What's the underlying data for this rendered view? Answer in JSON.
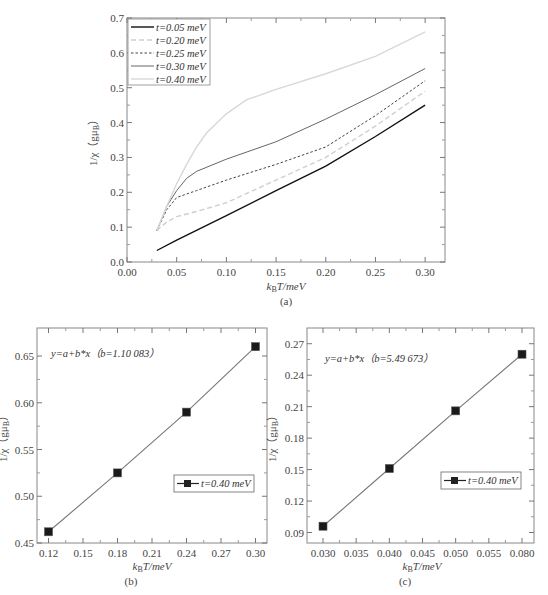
{
  "chart_data": [
    {
      "type": "line",
      "panel_label": "(a)",
      "title": "",
      "xlabel": "k_B T/meV",
      "ylabel": "1/χ (gμ_B)",
      "xlim": [
        0.0,
        0.32
      ],
      "ylim": [
        0.0,
        0.7
      ],
      "xticks": [
        "0.00",
        "0.05",
        "0.10",
        "0.15",
        "0.20",
        "0.25",
        "0.30"
      ],
      "yticks": [
        "0.0",
        "0.1",
        "0.2",
        "0.3",
        "0.4",
        "0.5",
        "0.6",
        "0.7"
      ],
      "grid": false,
      "legend_position": "upper left",
      "series": [
        {
          "name": "t=0.05 meV",
          "style": "solid-black",
          "x": [
            0.03,
            0.05,
            0.1,
            0.15,
            0.2,
            0.25,
            0.3
          ],
          "y": [
            0.033,
            0.063,
            0.133,
            0.205,
            0.275,
            0.36,
            0.45
          ]
        },
        {
          "name": "t=0.20 meV",
          "style": "dashed-lightgray",
          "x": [
            0.03,
            0.04,
            0.05,
            0.07,
            0.1,
            0.15,
            0.2,
            0.25,
            0.3
          ],
          "y": [
            0.09,
            0.115,
            0.13,
            0.145,
            0.17,
            0.235,
            0.3,
            0.39,
            0.49
          ]
        },
        {
          "name": "t=0.25 meV",
          "style": "dotted-darkgray",
          "x": [
            0.03,
            0.04,
            0.05,
            0.06,
            0.07,
            0.1,
            0.15,
            0.2,
            0.25,
            0.3
          ],
          "y": [
            0.09,
            0.15,
            0.185,
            0.195,
            0.205,
            0.235,
            0.28,
            0.33,
            0.42,
            0.52
          ]
        },
        {
          "name": "t=0.30 meV",
          "style": "solid-gray",
          "x": [
            0.03,
            0.04,
            0.05,
            0.06,
            0.07,
            0.1,
            0.15,
            0.2,
            0.25,
            0.3
          ],
          "y": [
            0.09,
            0.16,
            0.205,
            0.24,
            0.26,
            0.295,
            0.345,
            0.41,
            0.48,
            0.555
          ]
        },
        {
          "name": "t=0.40 meV",
          "style": "solid-lightgray",
          "x": [
            0.03,
            0.04,
            0.05,
            0.06,
            0.07,
            0.08,
            0.1,
            0.12,
            0.15,
            0.2,
            0.25,
            0.3
          ],
          "y": [
            0.09,
            0.16,
            0.225,
            0.28,
            0.33,
            0.37,
            0.425,
            0.465,
            0.495,
            0.54,
            0.59,
            0.66
          ]
        }
      ]
    },
    {
      "type": "line",
      "panel_label": "(b)",
      "title": "",
      "annotation": "y=a+b*x (b=1.10 083)",
      "xlabel": "k_B T/meV",
      "ylabel": "1/χ (gμ_B)",
      "xlim": [
        0.11,
        0.31
      ],
      "ylim": [
        0.45,
        0.68
      ],
      "xticks": [
        "0.12",
        "0.15",
        "0.18",
        "0.21",
        "0.24",
        "0.27",
        "0.30"
      ],
      "yticks": [
        "0.45",
        "0.50",
        "0.55",
        "0.60",
        "0.65"
      ],
      "grid": false,
      "legend_position": "center right",
      "series": [
        {
          "name": "t=0.40 meV",
          "marker": "square",
          "x": [
            0.12,
            0.18,
            0.24,
            0.3
          ],
          "y": [
            0.462,
            0.525,
            0.59,
            0.66
          ]
        }
      ]
    },
    {
      "type": "line",
      "panel_label": "(c)",
      "title": "",
      "annotation": "y=a+b*x (b=5.49 673)",
      "xlabel": "k_B T/meV",
      "ylabel": "1/χ (gμ_B)",
      "xlim": [
        0.0275,
        0.0825
      ],
      "ylim": [
        0.08,
        0.285
      ],
      "xticks": [
        "0.030",
        "0.035",
        "0.040",
        "0.045",
        "0.050",
        "0.055",
        "0.080"
      ],
      "yticks": [
        "0.09",
        "0.12",
        "0.15",
        "0.18",
        "0.21",
        "0.24",
        "0.27"
      ],
      "grid": false,
      "legend_position": "center right",
      "series": [
        {
          "name": "t=0.40 meV",
          "marker": "square",
          "x": [
            0.03,
            0.04,
            0.05,
            0.08
          ],
          "y": [
            0.096,
            0.151,
            0.206,
            0.26
          ]
        }
      ]
    }
  ],
  "labels": {
    "a": {
      "panel": "(a)",
      "xlabel_k": "k",
      "xlabel_sub": "B",
      "xlabel_rest": "T/meV",
      "ylabel": "1/χ（gμ",
      "ylabel_sub": "B",
      "ylabel_end": "）",
      "legend": [
        "t=0.05 meV",
        "t=0.20 meV",
        "t=0.25 meV",
        "t=0.30 meV",
        "t=0.40 meV"
      ]
    },
    "b": {
      "panel": "(b)",
      "annotation": "y=a+b*x（b=1.10 083）",
      "legend": "t=0.40 meV",
      "xlabel_k": "k",
      "xlabel_sub": "B",
      "xlabel_rest": "T/meV",
      "ylabel": "1/χ（gμ",
      "ylabel_sub": "B",
      "ylabel_end": "）"
    },
    "c": {
      "panel": "(c)",
      "annotation": "y=a+b*x（b=5.49 673）",
      "legend": "t=0.40 meV",
      "xlabel_k": "k",
      "xlabel_sub": "B",
      "xlabel_rest": "T/meV",
      "ylabel": "1/χ（gμ",
      "ylabel_sub": "B",
      "ylabel_end": "）"
    }
  }
}
